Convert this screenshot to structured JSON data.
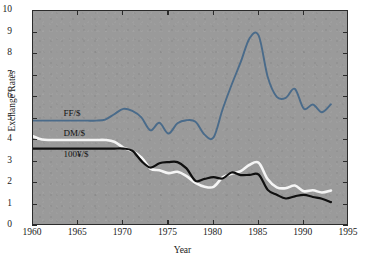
{
  "chart_data": {
    "type": "line",
    "title": "",
    "xlabel": "Year",
    "ylabel": "Exchange Rates",
    "xlim": [
      1960,
      1995
    ],
    "ylim": [
      0,
      10
    ],
    "xticks": [
      1960,
      1965,
      1970,
      1975,
      1980,
      1985,
      1990,
      1995
    ],
    "yticks": [
      0,
      1,
      2,
      3,
      4,
      5,
      6,
      7,
      8,
      9,
      10
    ],
    "grid": false,
    "legend_position": "inline-left",
    "plot_background": "#9a9a9a",
    "series": [
      {
        "name": "FF/$",
        "color": "#4a6b8a",
        "label_x": 1963.5,
        "label_y": 5.15,
        "x": [
          1960,
          1961,
          1962,
          1963,
          1964,
          1965,
          1966,
          1967,
          1968,
          1969,
          1970,
          1971,
          1972,
          1973,
          1974,
          1975,
          1976,
          1977,
          1978,
          1979,
          1980,
          1981,
          1982,
          1983,
          1984,
          1985,
          1986,
          1987,
          1988,
          1989,
          1990,
          1991,
          1992,
          1993
        ],
        "values": [
          4.9,
          4.9,
          4.9,
          4.9,
          4.9,
          4.9,
          4.9,
          4.9,
          4.95,
          5.2,
          5.45,
          5.35,
          5.05,
          4.45,
          4.8,
          4.3,
          4.78,
          4.92,
          4.85,
          4.25,
          4.12,
          5.43,
          6.57,
          7.62,
          8.74,
          8.85,
          6.93,
          6.01,
          5.96,
          6.38,
          5.45,
          5.65,
          5.29,
          5.66
        ]
      },
      {
        "name": "DM/$",
        "color": "#f5f5f5",
        "label_x": 1963.5,
        "label_y": 4.25,
        "x": [
          1960,
          1961,
          1962,
          1963,
          1964,
          1965,
          1966,
          1967,
          1968,
          1969,
          1970,
          1971,
          1972,
          1973,
          1974,
          1975,
          1976,
          1977,
          1978,
          1979,
          1980,
          1981,
          1982,
          1983,
          1984,
          1985,
          1986,
          1987,
          1988,
          1989,
          1990,
          1991,
          1992,
          1993
        ],
        "values": [
          4.17,
          4.02,
          4.0,
          4.0,
          4.0,
          4.0,
          4.0,
          4.0,
          4.0,
          3.92,
          3.65,
          3.48,
          3.19,
          2.67,
          2.59,
          2.46,
          2.52,
          2.32,
          2.01,
          1.83,
          1.82,
          2.26,
          2.43,
          2.55,
          2.85,
          2.94,
          2.17,
          1.8,
          1.76,
          1.88,
          1.62,
          1.66,
          1.56,
          1.65
        ]
      },
      {
        "name": "100¥/$",
        "color": "#101010",
        "label_x": 1963.5,
        "label_y": 3.25,
        "x": [
          1960,
          1961,
          1962,
          1963,
          1964,
          1965,
          1966,
          1967,
          1968,
          1969,
          1970,
          1971,
          1972,
          1973,
          1974,
          1975,
          1976,
          1977,
          1978,
          1979,
          1980,
          1981,
          1982,
          1983,
          1984,
          1985,
          1986,
          1987,
          1988,
          1989,
          1990,
          1991,
          1992,
          1993
        ],
        "values": [
          3.6,
          3.6,
          3.6,
          3.6,
          3.6,
          3.6,
          3.6,
          3.6,
          3.6,
          3.6,
          3.6,
          3.5,
          3.03,
          2.72,
          2.92,
          2.97,
          2.97,
          2.68,
          2.1,
          2.19,
          2.27,
          2.21,
          2.49,
          2.37,
          2.38,
          2.39,
          1.68,
          1.45,
          1.28,
          1.38,
          1.45,
          1.35,
          1.27,
          1.11
        ]
      }
    ]
  }
}
